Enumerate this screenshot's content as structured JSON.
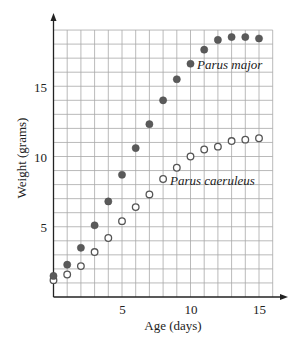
{
  "chart_data": {
    "type": "scatter",
    "title": "",
    "xlabel": "Age (days)",
    "ylabel": "Weight (grams)",
    "xlim": [
      0,
      16
    ],
    "ylim": [
      0,
      19
    ],
    "x_ticks": [
      5,
      10,
      15
    ],
    "y_ticks": [
      5,
      10,
      15
    ],
    "grid": true,
    "grid_step_x": 1,
    "grid_step_y": 1,
    "legend": "inline annotations",
    "x": [
      0,
      1,
      2,
      3,
      4,
      5,
      6,
      7,
      8,
      9,
      10,
      11,
      12,
      13,
      14,
      15
    ],
    "series": [
      {
        "name": "Parus major",
        "marker": "filled-circle",
        "color": "#5a5a5a",
        "label_at_index": 10,
        "values": [
          1.5,
          2.3,
          3.5,
          5.1,
          6.8,
          8.7,
          10.6,
          12.3,
          14.0,
          15.5,
          16.6,
          17.6,
          18.3,
          18.5,
          18.5,
          18.4
        ]
      },
      {
        "name": "Parus caeruleus",
        "marker": "open-circle",
        "color": "#555555",
        "label_at_index": 8,
        "values": [
          1.2,
          1.6,
          2.2,
          3.2,
          4.2,
          5.4,
          6.4,
          7.3,
          8.4,
          9.2,
          10.0,
          10.5,
          10.7,
          11.1,
          11.2,
          11.3
        ]
      }
    ]
  },
  "labels": {
    "xlabel": "Age (days)",
    "ylabel": "Weight (grams)",
    "series_major": "Parus major",
    "series_caeruleus": "Parus caeruleus",
    "x_tick_5": "5",
    "x_tick_10": "10",
    "x_tick_15": "15",
    "y_tick_5": "5",
    "y_tick_10": "10",
    "y_tick_15": "15"
  }
}
